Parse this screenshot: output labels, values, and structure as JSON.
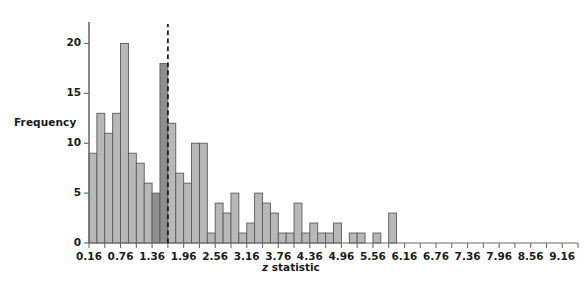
{
  "chart_data": {
    "type": "bar",
    "title": "",
    "subtitle": "",
    "xlabel": "z statistic",
    "xlabel_italic_part": "z",
    "xlabel_rest": " statistic",
    "ylabel": "Frequency",
    "grid": false,
    "legend_position": "none",
    "bin_width": 0.3,
    "x_start": 0.16,
    "xlim": [
      0.16,
      9.46
    ],
    "ylim": [
      0,
      21.5
    ],
    "y_ticks": [
      0,
      5,
      10,
      15,
      20
    ],
    "y_tick_labels": [
      "0",
      "5",
      "10",
      "15",
      "20"
    ],
    "x_tick_labels": [
      "0.16",
      "0.76",
      "1.36",
      "1.96",
      "2.56",
      "3.16",
      "3.76",
      "4.36",
      "4.96",
      "5.56",
      "6.16",
      "6.76",
      "7.36",
      "7.96",
      "8.56",
      "9.16"
    ],
    "x_tick_values": [
      0.16,
      0.76,
      1.36,
      1.96,
      2.56,
      3.16,
      3.76,
      4.36,
      4.96,
      5.56,
      6.16,
      6.76,
      7.36,
      7.96,
      8.56,
      9.16
    ],
    "annotation": {
      "type": "vertical-dashed-line",
      "x": 1.96,
      "label": "1.96 significance threshold"
    },
    "bin_edges": [
      0.16,
      0.46,
      0.76,
      1.06,
      1.36,
      1.66,
      1.96,
      2.26,
      2.56,
      2.86,
      3.16,
      3.46,
      3.76,
      4.06,
      4.36,
      4.66,
      4.96,
      5.26,
      5.56,
      5.86,
      6.16,
      6.46,
      6.76,
      7.06,
      7.36,
      7.66,
      7.96,
      8.26,
      8.56,
      8.86,
      9.16,
      9.46
    ],
    "categories": [
      "0.16",
      "0.46",
      "0.76",
      "1.06",
      "1.36",
      "1.66",
      "1.96",
      "2.26",
      "2.56",
      "2.86",
      "3.16",
      "3.46",
      "3.76",
      "4.06",
      "4.36",
      "4.66",
      "4.96",
      "5.26",
      "5.56",
      "5.86",
      "6.16",
      "6.46",
      "6.76",
      "7.06",
      "7.36",
      "7.66",
      "7.96",
      "8.26",
      "8.56",
      "8.86",
      "9.16",
      "9.46"
    ],
    "bars": [
      {
        "x0": 0.16,
        "x1": 0.31,
        "value": 9,
        "highlight": false
      },
      {
        "x0": 0.31,
        "x1": 0.46,
        "value": 13,
        "highlight": false
      },
      {
        "x0": 0.46,
        "x1": 0.61,
        "value": 11,
        "highlight": false
      },
      {
        "x0": 0.61,
        "x1": 0.76,
        "value": 13,
        "highlight": false
      },
      {
        "x0": 0.76,
        "x1": 0.91,
        "value": 20,
        "highlight": false
      },
      {
        "x0": 0.91,
        "x1": 1.06,
        "value": 9,
        "highlight": false
      },
      {
        "x0": 1.06,
        "x1": 1.21,
        "value": 8,
        "highlight": false
      },
      {
        "x0": 1.21,
        "x1": 1.36,
        "value": 6,
        "highlight": false
      },
      {
        "x0": 1.36,
        "x1": 1.51,
        "value": 5,
        "highlight": true
      },
      {
        "x0": 1.51,
        "x1": 1.66,
        "value": 18,
        "highlight": true
      },
      {
        "x0": 1.66,
        "x1": 1.81,
        "value": 12,
        "highlight": false
      },
      {
        "x0": 1.81,
        "x1": 1.96,
        "value": 7,
        "highlight": false
      },
      {
        "x0": 1.96,
        "x1": 2.11,
        "value": 6,
        "highlight": false
      },
      {
        "x0": 2.11,
        "x1": 2.26,
        "value": 10,
        "highlight": false
      },
      {
        "x0": 2.26,
        "x1": 2.41,
        "value": 10,
        "highlight": false
      },
      {
        "x0": 2.41,
        "x1": 2.56,
        "value": 1,
        "highlight": false
      },
      {
        "x0": 2.56,
        "x1": 2.71,
        "value": 4,
        "highlight": false
      },
      {
        "x0": 2.71,
        "x1": 2.86,
        "value": 3,
        "highlight": false
      },
      {
        "x0": 2.86,
        "x1": 3.01,
        "value": 5,
        "highlight": false
      },
      {
        "x0": 3.01,
        "x1": 3.16,
        "value": 1,
        "highlight": false
      },
      {
        "x0": 3.16,
        "x1": 3.31,
        "value": 2,
        "highlight": false
      },
      {
        "x0": 3.31,
        "x1": 3.46,
        "value": 5,
        "highlight": false
      },
      {
        "x0": 3.46,
        "x1": 3.61,
        "value": 4,
        "highlight": false
      },
      {
        "x0": 3.61,
        "x1": 3.76,
        "value": 3,
        "highlight": false
      },
      {
        "x0": 3.76,
        "x1": 3.91,
        "value": 1,
        "highlight": false
      },
      {
        "x0": 3.91,
        "x1": 4.06,
        "value": 1,
        "highlight": false
      },
      {
        "x0": 4.06,
        "x1": 4.21,
        "value": 4,
        "highlight": false
      },
      {
        "x0": 4.21,
        "x1": 4.36,
        "value": 1,
        "highlight": false
      },
      {
        "x0": 4.36,
        "x1": 4.51,
        "value": 2,
        "highlight": false
      },
      {
        "x0": 4.51,
        "x1": 4.66,
        "value": 1,
        "highlight": false
      },
      {
        "x0": 4.66,
        "x1": 4.81,
        "value": 1,
        "highlight": false
      },
      {
        "x0": 4.81,
        "x1": 4.96,
        "value": 2,
        "highlight": false
      },
      {
        "x0": 5.11,
        "x1": 5.26,
        "value": 1,
        "highlight": false
      },
      {
        "x0": 5.26,
        "x1": 5.41,
        "value": 1,
        "highlight": false
      },
      {
        "x0": 5.56,
        "x1": 5.71,
        "value": 1,
        "highlight": false
      },
      {
        "x0": 5.86,
        "x1": 6.01,
        "value": 3,
        "highlight": false
      }
    ],
    "bar_values": [
      9,
      13,
      11,
      13,
      20,
      9,
      8,
      6,
      5,
      18,
      12,
      7,
      6,
      10,
      10,
      1,
      4,
      3,
      5,
      1,
      2,
      5,
      4,
      3,
      1,
      1,
      4,
      1,
      2,
      1,
      1,
      2,
      1,
      1,
      1,
      3
    ],
    "colors": {
      "bar_fill": "#b8b8b8",
      "bar_fill_highlight": "#8e8e8e",
      "bar_stroke": "#5a5a5a",
      "axis": "#6d6d6d",
      "text": "#1b1b1b",
      "annotation_line": "#1b1b1b",
      "background": "#ffffff"
    }
  }
}
